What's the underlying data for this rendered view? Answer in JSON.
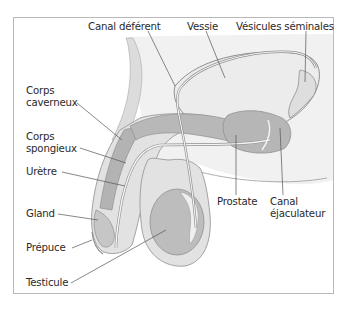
{
  "diagram": {
    "colors": {
      "frame_border": "#b9b9b9",
      "body_outline": "#9a9a9a",
      "skin_fill": "#e2e2e2",
      "bladder_fill": "#ececec",
      "organ_dark": "#b3b3b3",
      "organ_mid": "#c6c6c6",
      "testis_fill": "#bdbdbd",
      "leader_line": "#555555",
      "text": "#2a2a2a"
    },
    "labels": {
      "canal_deferent": "Canal déférent",
      "vessie": "Vessie",
      "vesicules_seminales": "Vésicules séminales",
      "corps_caverneux_1": "Corps",
      "corps_caverneux_2": "caverneux",
      "corps_spongieux_1": "Corps",
      "corps_spongieux_2": "spongieux",
      "uretre": "Urètre",
      "gland": "Gland",
      "prepuce": "Prépuce",
      "testicule": "Testicule",
      "prostate": "Prostate",
      "canal_ejaculateur_1": "Canal",
      "canal_ejaculateur_2": "éjaculateur"
    }
  }
}
